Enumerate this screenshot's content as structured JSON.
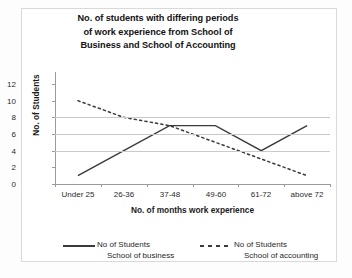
{
  "chart_data": {
    "type": "line",
    "title": "No. of students with differing periods of work experience from School of Business and School of Accounting",
    "title_lines": [
      "No. of students with differing periods",
      "of work experience from School of",
      "Business and School of Accounting"
    ],
    "categories": [
      "Under 25",
      "26-36",
      "37-48",
      "49-60",
      "61-72",
      "above 72"
    ],
    "series": [
      {
        "name": "No of Students School of business",
        "name_line1": "No of Students",
        "name_line2": "School of business",
        "style": "solid",
        "color": "#3a3a3a",
        "values": [
          1,
          4,
          7,
          7,
          4,
          7
        ]
      },
      {
        "name": "No of Students School of accounting",
        "name_line1": "No of Students",
        "name_line2": "School of accounting",
        "style": "dashed",
        "color": "#3a3a3a",
        "values": [
          10,
          8,
          7,
          5,
          3,
          1
        ]
      }
    ],
    "xlabel": "No. of months work experience",
    "ylabel": "No. of Students",
    "ylim": [
      0,
      12
    ],
    "ytick_values": [
      0,
      2,
      4,
      6,
      8,
      10,
      12
    ],
    "ytick_labels": [
      "0",
      "2",
      "4",
      "6",
      "8",
      "10",
      "12"
    ],
    "gridlines_at": [
      4,
      6,
      8
    ],
    "grid": true,
    "legend_position": "bottom"
  }
}
